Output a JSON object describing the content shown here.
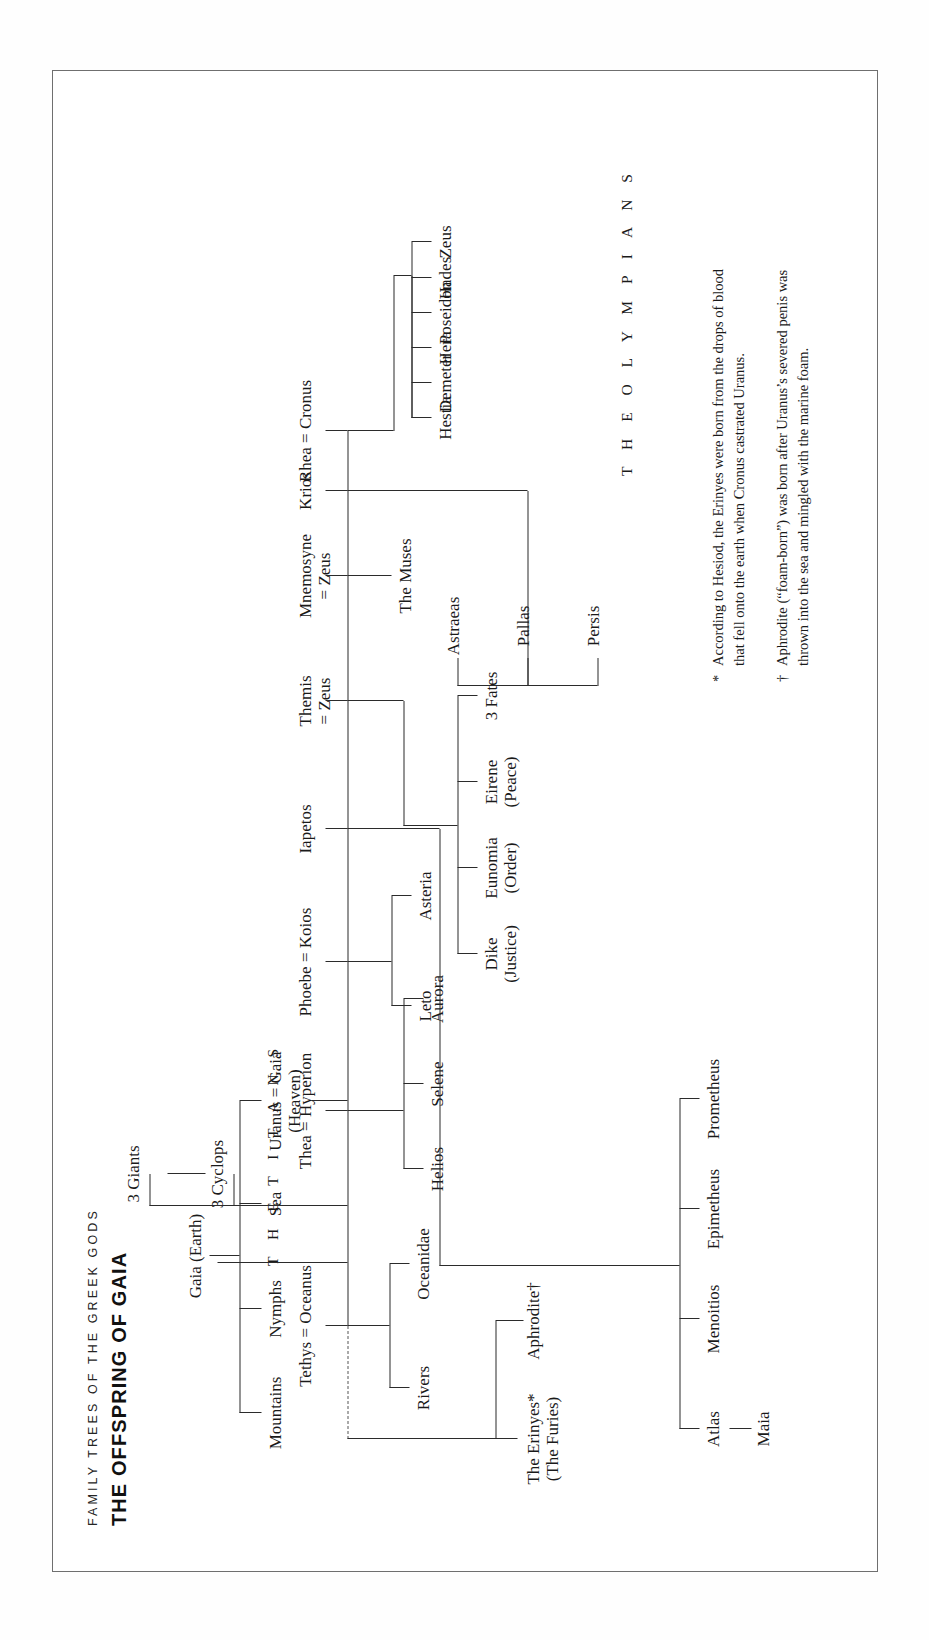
{
  "titles": {
    "kicker": "FAMILY TREES OF THE GREEK GODS",
    "main": "THE OFFSPRING OF GAIA"
  },
  "banners": {
    "titans": "T H E   T I T A N S",
    "olympians": "T H E   O L Y M P I A N S"
  },
  "nodes": {
    "gaia": "Gaia (Earth)",
    "uranus_gaia": "Uranus = Gaia",
    "uranus_sub": "(Heaven)",
    "mountains": "Mountains",
    "nymphs": "Nymphs",
    "sea": "Sea",
    "cyclops": "3 Cyclops",
    "giants": "3 Giants",
    "tethys_oceanus": "Tethys = Oceanus",
    "rivers": "Rivers",
    "oceanidae": "Oceanidae",
    "thea_hyperion": "Thea = Hyperion",
    "helios": "Helios",
    "selene": "Selene",
    "aurora": "Aurora",
    "phoebe_koios": "Phoebe = Koios",
    "leto": "Leto",
    "asteria": "Asteria",
    "iapetos": "Iapetos",
    "themis_zeus": "Themis",
    "themis_zeus_sub": "= Zeus",
    "mnemosyne_zeus": "Mnemosyne",
    "mnemosyne_zeus_sub": "= Zeus",
    "muses": "The Muses",
    "krios": "Krios",
    "rhea_cronus": "Rhea = Cronus",
    "dike": "Dike",
    "dike_sub": "(Justice)",
    "eunomia": "Eunomia",
    "eunomia_sub": "(Order)",
    "eirene": "Eirene",
    "eirene_sub": "(Peace)",
    "fates": "3 Fates",
    "persis": "Persis",
    "pallas": "Pallas",
    "astraeas": "Astraeas",
    "erinyes": "The Erinyes*",
    "erinyes_sub": "(The Furies)",
    "aphrodite": "Aphrodite†",
    "atlas": "Atlas",
    "maia": "Maia",
    "menoitios": "Menoitios",
    "epimetheus": "Epimetheus",
    "prometheus": "Prometheus",
    "hestia": "Hestia",
    "demeter": "Demeter",
    "hera": "Hera",
    "poseidon": "Poseidon",
    "hades": "Hades",
    "zeus": "Zeus"
  },
  "footnotes": [
    {
      "marker": "*",
      "text": "According to Hesiod, the Erinyes were born from the drops of blood that fell onto the earth when Cronus castrated Uranus."
    },
    {
      "marker": "†",
      "text": "Aphrodite (“foam-born”) was born after Uranus’s severed penis was thrown into the sea and mingled with the marine foam."
    }
  ],
  "colors": {
    "ink": "#1a1a1a",
    "rule": "#2b2b2b",
    "frame": "#6f6f6f",
    "paper": "#ffffff"
  }
}
